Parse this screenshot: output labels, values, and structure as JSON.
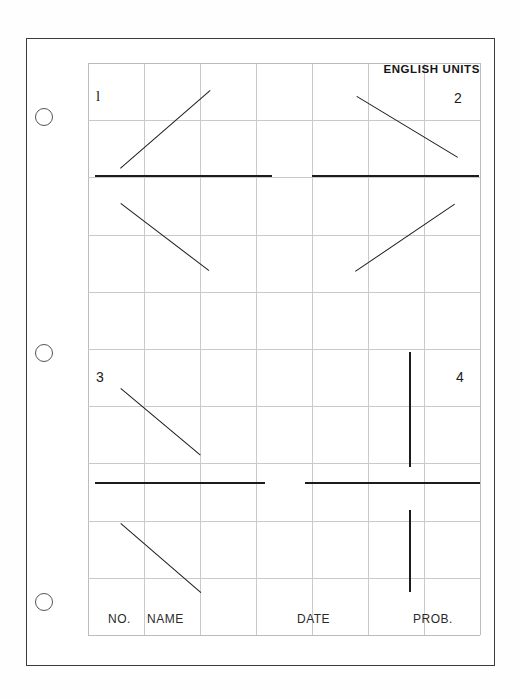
{
  "document": {
    "kind": "scanned-graph-paper-worksheet",
    "title": "ENGLISH UNITS",
    "background_color": "#ffffff",
    "ink_color": "#1c1c1c",
    "grid_color": "#c9c9cc",
    "border_color": "#3b3b3b"
  },
  "sheet": {
    "punch_holes": [
      {
        "name": "punch-hole-top",
        "cx": 44,
        "cy": 117,
        "r": 9
      },
      {
        "name": "punch-hole-middle",
        "cx": 44,
        "cy": 353,
        "r": 9
      },
      {
        "name": "punch-hole-bottom",
        "cx": 44,
        "cy": 602,
        "r": 9
      }
    ]
  },
  "grid": {
    "columns": 7,
    "rows": 10,
    "cell_width": 56,
    "cell_height": 57.2,
    "left": 88,
    "top": 63,
    "width": 392,
    "height": 572
  },
  "quadrants": [
    {
      "id": "1",
      "label": "l",
      "label_x": 8,
      "label_y": 26,
      "style": "serif-one"
    },
    {
      "id": "2",
      "label": "2",
      "label_x": 366,
      "label_y": 28,
      "style": "plain"
    },
    {
      "id": "3",
      "label": "3",
      "label_x": 8,
      "label_y": 307,
      "style": "plain"
    },
    {
      "id": "4",
      "label": "4",
      "label_x": 368,
      "label_y": 307,
      "style": "plain"
    }
  ],
  "plot_strokes": {
    "axis_horizontals": [
      {
        "name": "axis-line-q1",
        "x": 7,
        "y": 112,
        "w": 177
      },
      {
        "name": "axis-line-q2",
        "x": 224,
        "y": 112,
        "w": 167
      },
      {
        "name": "axis-line-q3",
        "x": 7,
        "y": 419,
        "w": 170
      },
      {
        "name": "axis-line-q4",
        "x": 217,
        "y": 419,
        "w": 175
      }
    ],
    "verticals": [
      {
        "name": "stroke-q4-upper",
        "x": 321,
        "y": 289,
        "h": 115
      },
      {
        "name": "stroke-q4-lower",
        "x": 321,
        "y": 447,
        "h": 82
      }
    ],
    "diagonals": [
      {
        "name": "stroke-q1-upper",
        "x1": 32,
        "y1": 105,
        "x2": 122,
        "y2": 27
      },
      {
        "name": "stroke-q1-lower",
        "x1": 33,
        "y1": 140,
        "x2": 121,
        "y2": 207
      },
      {
        "name": "stroke-q2-upper",
        "x1": 269,
        "y1": 33,
        "x2": 370,
        "y2": 94
      },
      {
        "name": "stroke-q2-lower",
        "x1": 267,
        "y1": 208,
        "x2": 366,
        "y2": 141
      },
      {
        "name": "stroke-q3-upper",
        "x1": 33,
        "y1": 325,
        "x2": 113,
        "y2": 392
      },
      {
        "name": "stroke-q3-lower",
        "x1": 33,
        "y1": 460,
        "x2": 113,
        "y2": 529
      }
    ]
  },
  "footer": {
    "fields": [
      {
        "name": "field-no",
        "label": "NO.",
        "x": 20,
        "y": 549
      },
      {
        "name": "field-name",
        "label": "NAME",
        "x": 59,
        "y": 549
      },
      {
        "name": "field-date",
        "label": "DATE",
        "x": 209,
        "y": 549
      },
      {
        "name": "field-prob",
        "label": "PROB.",
        "x": 325,
        "y": 549
      }
    ]
  }
}
